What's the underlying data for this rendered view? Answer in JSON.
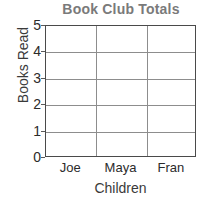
{
  "chart_data": {
    "type": "bar",
    "title": "Book Club Totals",
    "xlabel": "Children",
    "ylabel": "Books Read",
    "categories": [
      "Joe",
      "Maya",
      "Fran"
    ],
    "values": [
      null,
      null,
      null
    ],
    "series": [
      {
        "name": "Books Read",
        "values": [
          null,
          null,
          null
        ]
      }
    ],
    "yticks": [
      "0",
      "1",
      "2",
      "3",
      "4",
      "5"
    ],
    "ylim": [
      0,
      5
    ],
    "ytick_step": 1,
    "grid": true,
    "grid_horizontal": true,
    "grid_vertical": true,
    "legend": false,
    "legend_position": "none",
    "bars_drawn": false,
    "note": "Empty worksheet grid: axes and gridlines only, no bars plotted",
    "colors": {
      "title": "#7a7a7a",
      "axis_label": "#3a3a3a",
      "tick_label": "#2b2b2b",
      "plot_border": "#4a4a4a",
      "gridline": "#8d8d8d",
      "background": "#ffffff"
    }
  }
}
